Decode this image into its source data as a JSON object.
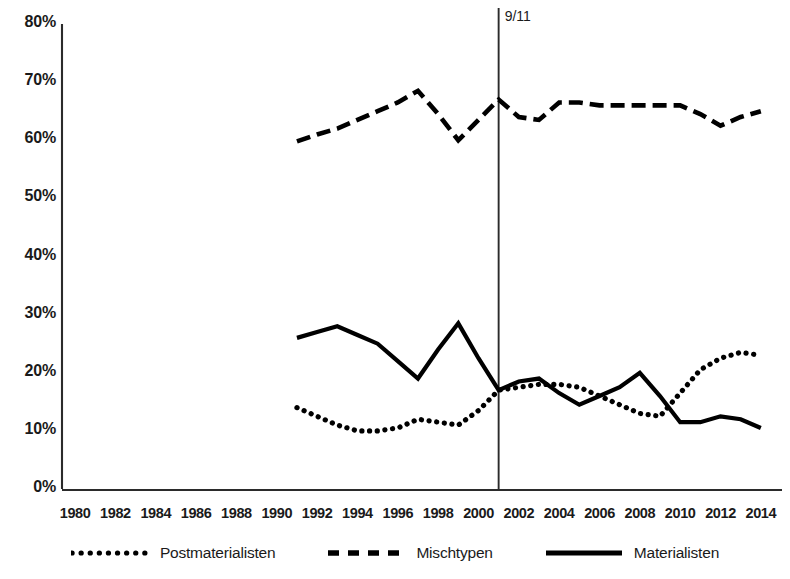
{
  "chart_data": {
    "type": "line",
    "title": "",
    "subtitle": "",
    "xlabel": "",
    "ylabel": "",
    "xlim": [
      1979,
      2015
    ],
    "ylim": [
      0,
      80
    ],
    "grid": false,
    "legend_position": "bottom",
    "x_ticks": [
      1980,
      1982,
      1984,
      1986,
      1988,
      1990,
      1992,
      1994,
      1996,
      1998,
      2000,
      2002,
      2004,
      2006,
      2008,
      2010,
      2012,
      2014
    ],
    "x_tick_labels": [
      "1980",
      "1982",
      "1984",
      "1986",
      "1988",
      "1990",
      "1992",
      "1994",
      "1996",
      "1998",
      "2000",
      "2002",
      "2004",
      "2006",
      "2008",
      "2010",
      "2012",
      "2014"
    ],
    "y_ticks": [
      0,
      10,
      20,
      30,
      40,
      50,
      60,
      70,
      80
    ],
    "y_tick_labels": [
      "0%",
      "10%",
      "20%",
      "30%",
      "40%",
      "50%",
      "60%",
      "70%",
      "80%"
    ],
    "annotations": [
      {
        "text": "9/11",
        "x": 2001,
        "kind": "vertical-line"
      }
    ],
    "series": [
      {
        "name": "Postmaterialisten",
        "style": "dotted",
        "color": "#000000",
        "x": [
          1991,
          1992,
          1993,
          1994,
          1995,
          1996,
          1997,
          1998,
          1999,
          2000,
          2001,
          2002,
          2003,
          2004,
          2005,
          2006,
          2007,
          2008,
          2009,
          2010,
          2011,
          2012,
          2013,
          2014
        ],
        "values": [
          14.0,
          12.5,
          11.0,
          10.0,
          10.0,
          10.5,
          12.0,
          11.5,
          11.0,
          13.5,
          17.0,
          17.5,
          18.0,
          18.0,
          17.5,
          16.0,
          14.5,
          13.0,
          12.5,
          16.5,
          20.5,
          22.5,
          23.5,
          23.0
        ]
      },
      {
        "name": "Mischtypen",
        "style": "dashed",
        "color": "#000000",
        "x": [
          1991,
          1992,
          1993,
          1994,
          1995,
          1996,
          1997,
          1998,
          1999,
          2000,
          2001,
          2002,
          2003,
          2004,
          2005,
          2006,
          2007,
          2008,
          2009,
          2010,
          2011,
          2012,
          2013,
          2014
        ],
        "values": [
          59.8,
          61.0,
          62.0,
          63.5,
          65.0,
          66.5,
          68.5,
          64.5,
          60.0,
          63.5,
          67.0,
          64.0,
          63.5,
          66.5,
          66.5,
          66.0,
          66.0,
          66.0,
          66.0,
          66.0,
          64.5,
          62.5,
          64.0,
          65.0
        ]
      },
      {
        "name": "Materialisten",
        "style": "solid",
        "color": "#000000",
        "x": [
          1991,
          1992,
          1993,
          1994,
          1995,
          1996,
          1997,
          1998,
          1999,
          2000,
          2001,
          2002,
          2003,
          2004,
          2005,
          2006,
          2007,
          2008,
          2009,
          2010,
          2011,
          2012,
          2013,
          2014
        ],
        "values": [
          26.0,
          27.0,
          28.0,
          26.5,
          25.0,
          22.0,
          19.0,
          24.0,
          28.5,
          22.5,
          17.0,
          18.5,
          19.0,
          16.5,
          14.5,
          16.0,
          17.5,
          20.0,
          16.0,
          11.5,
          11.5,
          12.5,
          12.0,
          10.5
        ]
      }
    ]
  },
  "legend": {
    "entries": [
      {
        "label": "Postmaterialisten",
        "swatch": "dotted-line-swatch"
      },
      {
        "label": "Mischtypen",
        "swatch": "dashed-line-swatch"
      },
      {
        "label": "Materialisten",
        "swatch": "solid-line-swatch"
      }
    ]
  }
}
